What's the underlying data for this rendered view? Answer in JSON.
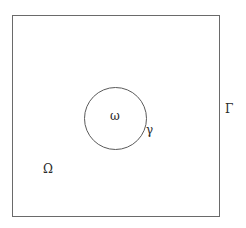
{
  "diagram": {
    "type": "domain-with-subdomain",
    "outer_domain": {
      "shape": "square",
      "region_label": "Ω",
      "boundary_label": "Γ"
    },
    "inner_domain": {
      "shape": "circle",
      "region_label": "ω",
      "boundary_label": "γ"
    },
    "colors": {
      "line": "#6a6a6a",
      "text": "#2a2a2a",
      "background": "#ffffff"
    }
  }
}
